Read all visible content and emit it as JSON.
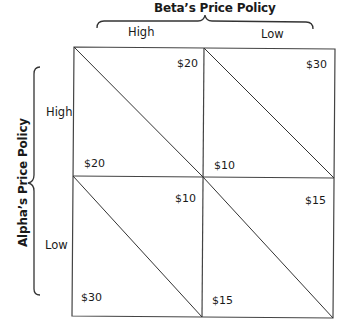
{
  "diagram": {
    "type": "payoff-matrix",
    "column_player": {
      "title": "Beta’s Price Policy",
      "strategies": [
        "High",
        "Low"
      ]
    },
    "row_player": {
      "title": "Alpha’s Price Policy",
      "strategies": [
        "High",
        "Low"
      ]
    },
    "cells": [
      {
        "row": "High",
        "col": "High",
        "beta_payoff": "$20",
        "alpha_payoff": "$20"
      },
      {
        "row": "High",
        "col": "Low",
        "beta_payoff": "$30",
        "alpha_payoff": "$10"
      },
      {
        "row": "Low",
        "col": "High",
        "beta_payoff": "$10",
        "alpha_payoff": "$30"
      },
      {
        "row": "Low",
        "col": "Low",
        "beta_payoff": "$15",
        "alpha_payoff": "$15"
      }
    ],
    "colors": {
      "line": "#333333",
      "text": "#1a1a1a",
      "background": "#ffffff"
    }
  }
}
